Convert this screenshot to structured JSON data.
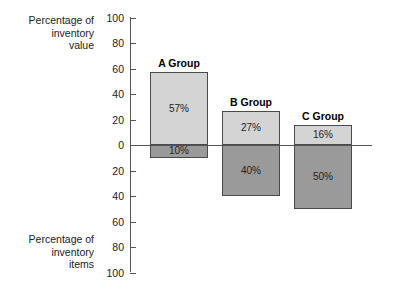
{
  "chart_data": {
    "type": "bar",
    "title": "",
    "subtitle": "",
    "orientation": "vertical",
    "stacked_diverging": true,
    "categories": [
      "A Group",
      "B Group",
      "C Group"
    ],
    "series": [
      {
        "name": "Percentage of inventory value",
        "direction": "up",
        "color": "#d4d4d4",
        "values": [
          57,
          27,
          16
        ],
        "value_labels": [
          "57%",
          "27%",
          "16%"
        ]
      },
      {
        "name": "Percentage of inventory items",
        "direction": "down",
        "color": "#9a9a9a",
        "values": [
          10,
          40,
          50
        ],
        "value_labels": [
          "10%",
          "40%",
          "50%"
        ]
      }
    ],
    "xlabel": "",
    "ylabel_top": "Percentage of inventory value",
    "ylabel_bottom": "Percentage of inventory items",
    "ylim": [
      -100,
      100
    ],
    "ytick_values": [
      100,
      80,
      60,
      40,
      20,
      0,
      20,
      40,
      60,
      80,
      100
    ],
    "ytick_labels": [
      "100",
      "80",
      "60",
      "40",
      "20",
      "0",
      "20",
      "40",
      "60",
      "80",
      "100"
    ],
    "grid": false,
    "legend": "none"
  },
  "axis": {
    "upper_caption": "Percentage of\ninventory\nvalue",
    "upper_caption_lines": [
      "Percentage of",
      "inventory",
      "value"
    ],
    "lower_caption_lines": [
      "Percentage of",
      "inventory",
      "items"
    ],
    "ticks": [
      {
        "label": "100"
      },
      {
        "label": "80"
      },
      {
        "label": "60"
      },
      {
        "label": "40"
      },
      {
        "label": "20"
      },
      {
        "label": "0"
      },
      {
        "label": "20"
      },
      {
        "label": "40"
      },
      {
        "label": "60"
      },
      {
        "label": "80"
      },
      {
        "label": "100"
      }
    ]
  },
  "bars": [
    {
      "label": "A Group",
      "top_value": "57%",
      "bottom_value": "10%"
    },
    {
      "label": "B Group",
      "top_value": "27%",
      "bottom_value": "40%"
    },
    {
      "label": "C Group",
      "top_value": "16%",
      "bottom_value": "50%"
    }
  ],
  "colors": {
    "value_segment": "#d4d4d4",
    "items_segment": "#9a9a9a",
    "axis": "#555555",
    "text": "#1a1a1a",
    "background": "#ffffff"
  }
}
